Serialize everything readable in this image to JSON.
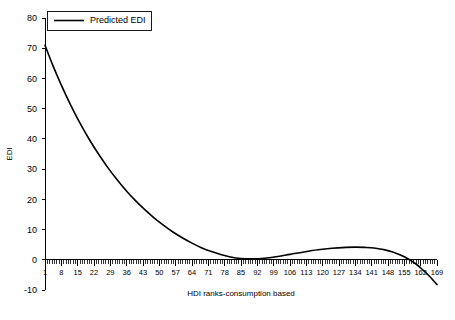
{
  "chart_data": {
    "type": "line",
    "title": "",
    "xlabel": "HDI ranks-consumption based",
    "ylabel": "EDI",
    "xlim": [
      1,
      169
    ],
    "ylim": [
      -10,
      80
    ],
    "grid": false,
    "legend_position": "top-left",
    "y_ticks": [
      -10,
      0,
      10,
      20,
      30,
      40,
      50,
      60,
      70,
      80
    ],
    "y_tick_labels": [
      "-10",
      "0",
      "10",
      "20",
      "30",
      "40",
      "50",
      "60",
      "70",
      "80"
    ],
    "x_ticks": [
      1,
      8,
      15,
      22,
      29,
      36,
      43,
      50,
      57,
      64,
      71,
      78,
      85,
      92,
      99,
      106,
      113,
      120,
      127,
      134,
      141,
      148,
      155,
      162,
      169
    ],
    "x_tick_labels": [
      "1",
      "8",
      "15",
      "22",
      "29",
      "36",
      "43",
      "50",
      "57",
      "64",
      "71",
      "78",
      "85",
      "92",
      "99",
      "106",
      "113",
      "120",
      "127",
      "134",
      "141",
      "148",
      "155",
      "162",
      "169"
    ],
    "x_minor_tick_step": 1,
    "series": [
      {
        "name": "Predicted EDI",
        "color": "#000000",
        "x": [
          1,
          4,
          8,
          12,
          16,
          20,
          24,
          28,
          32,
          36,
          40,
          44,
          48,
          52,
          56,
          60,
          64,
          68,
          72,
          76,
          80,
          85,
          90,
          95,
          100,
          106,
          112,
          118,
          124,
          130,
          134,
          138,
          142,
          146,
          150,
          155,
          160,
          163,
          166,
          169
        ],
        "values": [
          71.0,
          65.0,
          57.8,
          51.2,
          45.2,
          39.8,
          34.9,
          30.4,
          26.4,
          22.7,
          19.4,
          16.4,
          13.7,
          11.3,
          9.1,
          7.2,
          5.5,
          4.0,
          2.8,
          1.8,
          1.0,
          0.4,
          0.3,
          0.5,
          1.0,
          1.8,
          2.6,
          3.3,
          3.8,
          4.1,
          4.2,
          4.1,
          3.9,
          3.4,
          2.6,
          1.0,
          -1.4,
          -3.4,
          -5.6,
          -8.2
        ]
      }
    ]
  },
  "legend": {
    "entries": [
      {
        "label": "Predicted EDI",
        "color": "#000000"
      }
    ]
  },
  "axes": {
    "y_axis_title": "EDI",
    "x_axis_title": "HDI ranks-consumption based"
  }
}
